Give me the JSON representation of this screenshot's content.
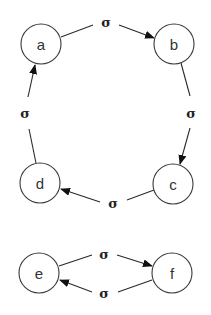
{
  "diagram": {
    "type": "state-transition",
    "nodes": [
      {
        "id": "a",
        "label": "a",
        "cx": 41,
        "cy": 44,
        "r": 20
      },
      {
        "id": "b",
        "label": "b",
        "cx": 174,
        "cy": 44,
        "r": 20
      },
      {
        "id": "c",
        "label": "c",
        "cx": 173,
        "cy": 184,
        "r": 20
      },
      {
        "id": "d",
        "label": "d",
        "cx": 40,
        "cy": 183,
        "r": 20
      },
      {
        "id": "e",
        "label": "e",
        "cx": 39,
        "cy": 273,
        "r": 20
      },
      {
        "id": "f",
        "label": "f",
        "cx": 172,
        "cy": 273,
        "r": 20
      }
    ],
    "edges": [
      {
        "from": "a",
        "to": "b",
        "label": "σ",
        "label_x": 106,
        "label_y": 22
      },
      {
        "from": "b",
        "to": "c",
        "label": "σ",
        "label_x": 191,
        "label_y": 113
      },
      {
        "from": "c",
        "to": "d",
        "label": "σ",
        "label_x": 113,
        "label_y": 203
      },
      {
        "from": "d",
        "to": "a",
        "label": "σ",
        "label_x": 25,
        "label_y": 113
      },
      {
        "from": "e",
        "to": "f",
        "label": "σ",
        "label_x": 104,
        "label_y": 254
      },
      {
        "from": "f",
        "to": "e",
        "label": "σ",
        "label_x": 104,
        "label_y": 293
      }
    ]
  }
}
